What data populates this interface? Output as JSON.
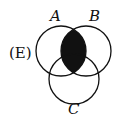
{
  "option_label": "(E)",
  "sets": [
    {
      "name": "A",
      "cx": 61,
      "cy": 51,
      "r": 25
    },
    {
      "name": "B",
      "cx": 86,
      "cy": 51,
      "r": 25
    },
    {
      "name": "C",
      "cx": 74,
      "cy": 79,
      "r": 25
    }
  ],
  "shaded_region": "A ∩ B",
  "colors": {
    "stroke": "#111111",
    "fill": "#111111",
    "background": "#ffffff"
  }
}
